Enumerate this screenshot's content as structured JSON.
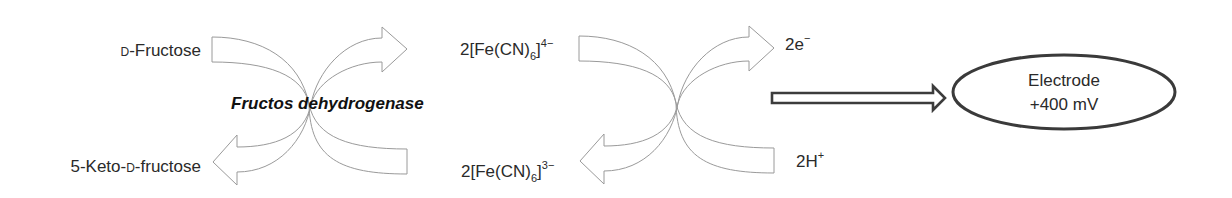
{
  "diagram": {
    "enzyme_reaction": {
      "substrate": {
        "prefix": "D",
        "name": "-Fructose"
      },
      "product": {
        "lead": "5-Keto-",
        "prefix": "D",
        "name": "-fructose"
      },
      "enzyme_label": "Fructos dehydrogenase"
    },
    "mediator_reaction": {
      "reduced": {
        "coef": "2[Fe(CN)",
        "sub": "6",
        "close": "]",
        "charge": "4−"
      },
      "oxidized": {
        "coef": "2[Fe(CN)",
        "sub": "6",
        "close": "]",
        "charge": "3−"
      },
      "electrons": {
        "base": "2e",
        "sup": "−"
      },
      "protons": {
        "base": "2H",
        "sup": "+"
      }
    },
    "electrode": {
      "line1": "Electrode",
      "line2": "+400 mV"
    },
    "icons": {
      "reaction_arrows": "curved-crossing-arrows-icon",
      "transfer_arrow": "hollow-right-arrow-icon"
    },
    "colors": {
      "arrow_outline": "#9a9a9a",
      "transfer_outline": "#3c3c3c",
      "electrode_outline": "#3a3a3a",
      "text": "#2a2a2a"
    }
  }
}
